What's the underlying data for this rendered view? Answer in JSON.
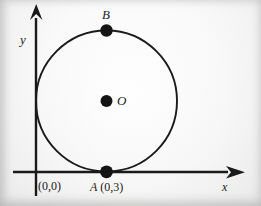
{
  "figure": {
    "type": "geometry-diagram",
    "background_color": "#f4f3f2",
    "ink_color": "#1a1a1a",
    "axes": {
      "x_label": "x",
      "y_label": "y",
      "origin_label": "(0,0)",
      "x_arrow": "arrow-right",
      "y_arrow": "arrow-up"
    },
    "points": [
      {
        "id": "A",
        "name": "A",
        "coords": "(0,3)",
        "label": "A (0,3)",
        "marker": "filled-dot",
        "position": "bottom-of-circle-on-x-axis"
      },
      {
        "id": "B",
        "name": "B",
        "coords": "",
        "label": "B",
        "marker": "filled-dot",
        "position": "top-of-circle"
      },
      {
        "id": "O",
        "name": "O",
        "coords": "",
        "label": "O",
        "marker": "filled-dot",
        "position": "center-of-circle"
      }
    ],
    "circle": {
      "center_label": "O",
      "stroke_color": "#1a1a1a"
    }
  },
  "chart_data": {
    "type": "scatter",
    "title": "",
    "xlabel": "x",
    "ylabel": "y",
    "grid": false,
    "legend": null,
    "annotations": [
      {
        "text": "B",
        "role": "point-label"
      },
      {
        "text": "O",
        "role": "center-label"
      },
      {
        "text": "A (0,3)",
        "role": "point-label"
      },
      {
        "text": "(0,0)",
        "role": "origin-label"
      },
      {
        "text": "x",
        "role": "axis-label"
      },
      {
        "text": "y",
        "role": "axis-label"
      }
    ],
    "shapes": [
      {
        "kind": "circle",
        "center_px": [
          106,
          101
        ],
        "radius_px": 71,
        "tangent_to": [
          "x-axis",
          "y-axis"
        ]
      }
    ],
    "points": [
      {
        "label": "B",
        "px": [
          106,
          30
        ]
      },
      {
        "label": "O",
        "px": [
          106,
          101
        ]
      },
      {
        "label": "A (0,3)",
        "px": [
          106,
          172
        ]
      }
    ]
  }
}
